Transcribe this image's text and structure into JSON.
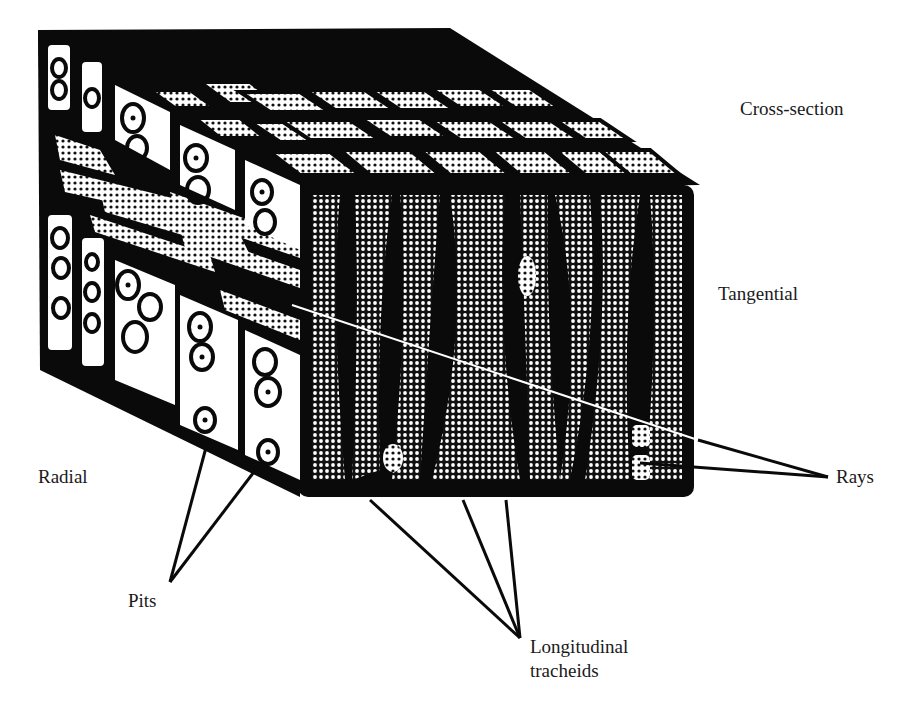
{
  "figure": {
    "colors": {
      "ink": "#0a0a0a",
      "paper": "#ffffff",
      "stipple_bg": "#1c1c1c"
    }
  },
  "labels": {
    "cross_section": "Cross-section",
    "tangential": "Tangential",
    "radial": "Radial",
    "rays": "Rays",
    "pits": "Pits",
    "longitudinal_line1": "Longitudinal",
    "longitudinal_line2": "tracheids"
  }
}
